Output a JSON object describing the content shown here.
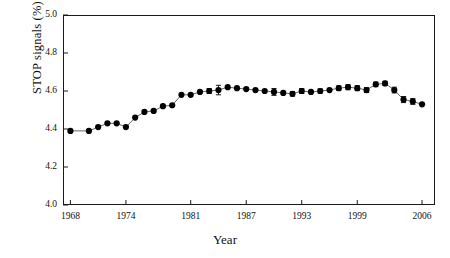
{
  "chart_data": {
    "type": "line",
    "title": "",
    "xlabel": "Year",
    "ylabel": "STOP signals (%)",
    "xlim": [
      1967.2,
      2007.4
    ],
    "ylim": [
      4.0,
      5.0
    ],
    "xticks": [
      1968,
      1974,
      1981,
      1987,
      1993,
      1999,
      2006
    ],
    "yticks": [
      "4.0",
      "4.2",
      "4.4",
      "4.6",
      "4.8",
      "5.0"
    ],
    "grid": false,
    "legend": null,
    "marker": "filled-circle",
    "series": [
      {
        "name": "STOP signals",
        "x": [
          1968,
          1970,
          1971,
          1972,
          1973,
          1974,
          1975,
          1976,
          1977,
          1978,
          1979,
          1980,
          1981,
          1982,
          1983,
          1984,
          1985,
          1986,
          1987,
          1988,
          1989,
          1990,
          1991,
          1992,
          1993,
          1994,
          1995,
          1996,
          1997,
          1998,
          1999,
          2000,
          2001,
          2002,
          2003,
          2004,
          2005,
          2006
        ],
        "values": [
          4.39,
          4.39,
          4.41,
          4.43,
          4.43,
          4.41,
          4.46,
          4.49,
          4.495,
          4.52,
          4.525,
          4.58,
          4.58,
          4.595,
          4.6,
          4.605,
          4.62,
          4.615,
          4.61,
          4.605,
          4.6,
          4.595,
          4.59,
          4.585,
          4.6,
          4.595,
          4.6,
          4.605,
          4.615,
          4.62,
          4.615,
          4.605,
          4.635,
          4.64,
          4.605,
          4.555,
          4.545,
          4.53
        ],
        "errors": [
          0,
          0,
          0,
          0,
          0,
          0,
          0,
          0,
          0,
          0,
          0,
          0,
          0,
          0,
          0.013,
          0.025,
          0,
          0,
          0,
          0,
          0,
          0.018,
          0,
          0.012,
          0.013,
          0,
          0.011,
          0,
          0.012,
          0.013,
          0.013,
          0.013,
          0.012,
          0.011,
          0.015,
          0.016,
          0.015,
          0
        ],
        "line_color": "#555555",
        "marker_color": "#000000"
      }
    ]
  }
}
